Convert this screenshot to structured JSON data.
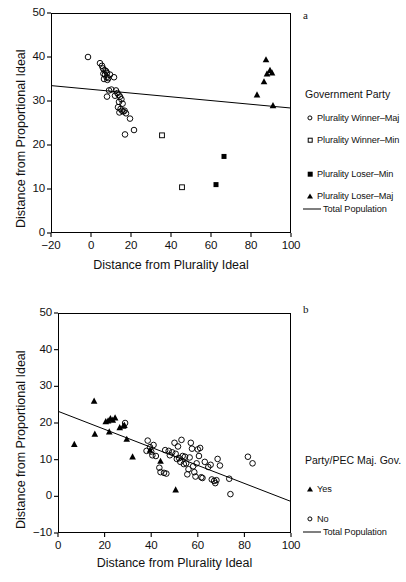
{
  "figure": {
    "panels": [
      {
        "letter": "a",
        "xlabel": "Distance from Plurality Ideal",
        "ylabel": "Distance from Proportional Ideal",
        "legend_title": "Government Party"
      },
      {
        "letter": "b",
        "xlabel": "Distance from Plurality Ideal",
        "ylabel": "Distance from Proportional Ideal",
        "legend_title": "Party/PEC Maj. Gov."
      }
    ]
  },
  "chart_data": [
    {
      "type": "scatter",
      "panel": "a",
      "title": "",
      "xlabel": "Distance from Plurality Ideal",
      "ylabel": "Distance from Proportional Ideal",
      "xlim": [
        -20,
        100
      ],
      "ylim": [
        0,
        50
      ],
      "xticks": [
        -20,
        0,
        20,
        40,
        60,
        80,
        100
      ],
      "yticks": [
        0,
        10,
        20,
        30,
        40,
        50
      ],
      "xticklabels": [
        "−20",
        "0",
        "20",
        "40",
        "60",
        "80",
        "100"
      ],
      "yticklabels": [
        "0",
        "10",
        "20",
        "30",
        "40",
        "50"
      ],
      "grid": false,
      "legend_position": "right",
      "legend_title": "Government Party",
      "series": [
        {
          "name": "Plurality Winner–Maj",
          "marker": "open-circle",
          "points": [
            [
              -1.5,
              40.0
            ],
            [
              4.5,
              38.6
            ],
            [
              5.5,
              38.0
            ],
            [
              6.0,
              37.4
            ],
            [
              6.8,
              37.0
            ],
            [
              7.5,
              36.8
            ],
            [
              6.2,
              36.2
            ],
            [
              7.0,
              36.0
            ],
            [
              8.0,
              36.4
            ],
            [
              7.8,
              35.4
            ],
            [
              6.5,
              35.0
            ],
            [
              8.6,
              35.2
            ],
            [
              9.5,
              36.0
            ],
            [
              8.2,
              34.8
            ],
            [
              11.5,
              35.4
            ],
            [
              9.0,
              32.4
            ],
            [
              10.2,
              32.6
            ],
            [
              8.0,
              31.0
            ],
            [
              12.5,
              32.4
            ],
            [
              13.2,
              31.8
            ],
            [
              13.8,
              31.4
            ],
            [
              12.0,
              31.2
            ],
            [
              14.5,
              31.0
            ],
            [
              15.2,
              30.4
            ],
            [
              14.0,
              29.8
            ],
            [
              15.8,
              29.4
            ],
            [
              13.5,
              28.6
            ],
            [
              14.8,
              28.2
            ],
            [
              15.5,
              27.8
            ],
            [
              16.2,
              27.6
            ],
            [
              14.2,
              27.4
            ],
            [
              16.8,
              27.8
            ],
            [
              17.5,
              27.2
            ],
            [
              19.5,
              26.0
            ],
            [
              17.0,
              22.4
            ],
            [
              21.5,
              23.4
            ]
          ]
        },
        {
          "name": "Plurality Winner–Min",
          "marker": "open-square",
          "points": [
            [
              35.5,
              22.2
            ],
            [
              45.5,
              10.4
            ]
          ]
        },
        {
          "name": "Plurality Loser–Min",
          "marker": "filled-square",
          "points": [
            [
              66.5,
              17.4
            ],
            [
              62.5,
              11.0
            ]
          ]
        },
        {
          "name": "Plurality Loser–Maj",
          "marker": "filled-triangle",
          "points": [
            [
              87.5,
              39.4
            ],
            [
              89.5,
              37.0
            ],
            [
              90.5,
              36.4
            ],
            [
              88.0,
              36.2
            ],
            [
              86.5,
              34.4
            ],
            [
              83.0,
              31.4
            ],
            [
              91.0,
              29.0
            ]
          ]
        },
        {
          "name": "Total Population",
          "marker": "line",
          "line": {
            "x": [
              -20,
              100
            ],
            "y": [
              33.5,
              28.4
            ]
          }
        }
      ]
    },
    {
      "type": "scatter",
      "panel": "b",
      "title": "",
      "xlabel": "Distance from Plurality Ideal",
      "ylabel": "Distance from Proportional Ideal",
      "xlim": [
        0,
        100
      ],
      "ylim": [
        -10,
        50
      ],
      "xticks": [
        0,
        20,
        40,
        60,
        80,
        100
      ],
      "yticks": [
        -10,
        0,
        10,
        20,
        30,
        40,
        50
      ],
      "xticklabels": [
        "0",
        "20",
        "40",
        "60",
        "80",
        "100"
      ],
      "yticklabels": [
        "−10",
        "0",
        "10",
        "20",
        "30",
        "40",
        "50"
      ],
      "grid": false,
      "legend_position": "right",
      "legend_title": "Party/PEC Maj. Gov.",
      "series": [
        {
          "name": "Yes",
          "marker": "filled-triangle",
          "points": [
            [
              7.0,
              14.2
            ],
            [
              15.5,
              26.0
            ],
            [
              15.8,
              17.0
            ],
            [
              20.5,
              20.4
            ],
            [
              21.5,
              20.6
            ],
            [
              22.5,
              21.2
            ],
            [
              23.5,
              20.8
            ],
            [
              22.0,
              17.6
            ],
            [
              24.5,
              21.4
            ],
            [
              26.5,
              18.8
            ],
            [
              28.0,
              19.2
            ],
            [
              28.5,
              19.4
            ],
            [
              29.5,
              15.6
            ],
            [
              32.0,
              10.8
            ],
            [
              39.5,
              12.6
            ],
            [
              44.0,
              9.6
            ],
            [
              50.5,
              1.8
            ]
          ]
        },
        {
          "name": "No",
          "marker": "open-circle",
          "points": [
            [
              28.8,
              20.0
            ],
            [
              38.5,
              15.2
            ],
            [
              39.5,
              13.4
            ],
            [
              38.0,
              12.4
            ],
            [
              40.0,
              12.2
            ],
            [
              41.0,
              14.0
            ],
            [
              40.5,
              11.2
            ],
            [
              42.0,
              11.0
            ],
            [
              43.5,
              7.8
            ],
            [
              44.0,
              6.6
            ],
            [
              45.5,
              6.4
            ],
            [
              46.5,
              6.2
            ],
            [
              46.0,
              12.6
            ],
            [
              47.5,
              12.4
            ],
            [
              48.0,
              11.2
            ],
            [
              49.0,
              12.0
            ],
            [
              50.0,
              14.6
            ],
            [
              50.5,
              11.6
            ],
            [
              51.0,
              10.2
            ],
            [
              51.5,
              13.6
            ],
            [
              52.0,
              10.4
            ],
            [
              52.5,
              9.4
            ],
            [
              53.0,
              15.4
            ],
            [
              53.5,
              11.0
            ],
            [
              54.0,
              8.8
            ],
            [
              54.5,
              10.8
            ],
            [
              55.0,
              9.0
            ],
            [
              55.5,
              6.0
            ],
            [
              56.0,
              7.4
            ],
            [
              56.5,
              10.6
            ],
            [
              57.0,
              14.6
            ],
            [
              57.5,
              13.0
            ],
            [
              58.0,
              8.2
            ],
            [
              58.5,
              6.6
            ],
            [
              59.0,
              5.4
            ],
            [
              59.5,
              9.0
            ],
            [
              60.0,
              12.8
            ],
            [
              60.5,
              11.0
            ],
            [
              61.0,
              13.2
            ],
            [
              61.5,
              5.2
            ],
            [
              62.0,
              5.0
            ],
            [
              63.0,
              9.4
            ],
            [
              64.5,
              8.0
            ],
            [
              65.5,
              8.6
            ],
            [
              66.0,
              4.6
            ],
            [
              67.0,
              4.2
            ],
            [
              67.5,
              3.6
            ],
            [
              68.0,
              4.4
            ],
            [
              68.5,
              10.2
            ],
            [
              69.5,
              8.4
            ],
            [
              73.5,
              4.8
            ],
            [
              74.0,
              0.6
            ],
            [
              81.5,
              10.8
            ],
            [
              83.5,
              9.0
            ]
          ]
        },
        {
          "name": "Total Population",
          "marker": "line",
          "line": {
            "x": [
              0,
              100
            ],
            "y": [
              23.2,
              -1.4
            ]
          }
        }
      ]
    }
  ],
  "legends": {
    "a": {
      "title": "Government Party",
      "entries": [
        {
          "label": "Plurality Winner–Maj",
          "symbol": "open-circle"
        },
        {
          "label": "Plurality Winner–Min",
          "symbol": "open-square"
        },
        {
          "label": "Plurality Loser–Min",
          "symbol": "filled-square"
        },
        {
          "label": "Plurality Loser–Maj",
          "symbol": "filled-triangle"
        },
        {
          "label": "Total Population",
          "symbol": "line"
        }
      ]
    },
    "b": {
      "title": "Party/PEC Maj. Gov.",
      "entries": [
        {
          "label": "Yes",
          "symbol": "filled-triangle"
        },
        {
          "label": "No",
          "symbol": "open-circle"
        },
        {
          "label": "Total Population",
          "symbol": "line"
        }
      ]
    }
  }
}
